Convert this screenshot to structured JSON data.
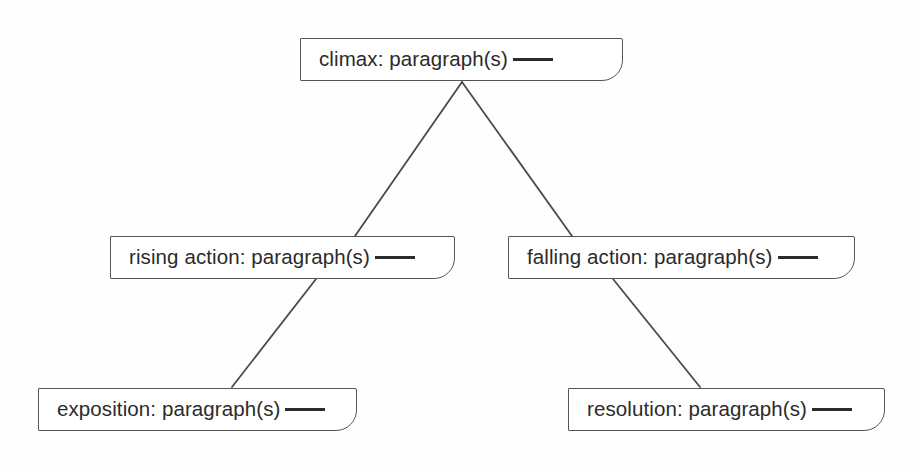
{
  "diagram": {
    "type": "plot-structure-diagram",
    "background_color": "#fefefe",
    "line_color": "#555555",
    "text_color": "#2b2b2b",
    "nodes": [
      {
        "id": "climax",
        "label": "climax: paragraph(s)",
        "has_blank": true,
        "x": 300,
        "y": 38,
        "width": 323,
        "height": 43
      },
      {
        "id": "rising-action",
        "label": "rising action: paragraph(s)",
        "has_blank": true,
        "x": 110,
        "y": 236,
        "width": 345,
        "height": 43
      },
      {
        "id": "falling-action",
        "label": "falling action: paragraph(s)",
        "has_blank": true,
        "x": 508,
        "y": 236,
        "width": 347,
        "height": 43
      },
      {
        "id": "exposition",
        "label": "exposition: paragraph(s)",
        "has_blank": true,
        "x": 38,
        "y": 388,
        "width": 319,
        "height": 43
      },
      {
        "id": "resolution",
        "label": "resolution: paragraph(s)",
        "has_blank": true,
        "x": 568,
        "y": 388,
        "width": 317,
        "height": 43
      }
    ],
    "connectors": [
      {
        "id": "climax-to-rising-action",
        "x1": 462,
        "y1": 82,
        "x2": 355,
        "y2": 236
      },
      {
        "id": "climax-to-falling-action",
        "x1": 462,
        "y1": 82,
        "x2": 572,
        "y2": 236
      },
      {
        "id": "rising-action-to-exposition",
        "x1": 316,
        "y1": 279,
        "x2": 232,
        "y2": 387
      },
      {
        "id": "falling-action-to-resolution",
        "x1": 613,
        "y1": 279,
        "x2": 700,
        "y2": 387
      }
    ]
  }
}
